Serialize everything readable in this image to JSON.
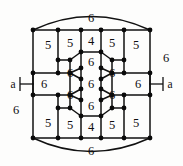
{
  "figure": {
    "background_color": "#fdfdfc",
    "line_color": "#111111",
    "vertex_color": "#0a0a0a"
  },
  "chart_data": {
    "type": "diagram",
    "title": "",
    "face_size_counts": {
      "4": 2,
      "5": 8,
      "6": 13
    },
    "faces": [
      {
        "id": "outer-top",
        "label": "6",
        "x": 91,
        "y": 18
      },
      {
        "id": "outer-bottom",
        "label": "6",
        "x": 91,
        "y": 151
      },
      {
        "id": "outer-left",
        "label": "6",
        "x": 16,
        "y": 110
      },
      {
        "id": "outer-right",
        "label": "6",
        "x": 166,
        "y": 58
      },
      {
        "id": "square-top",
        "label": "4",
        "x": 91,
        "y": 41
      },
      {
        "id": "square-bottom",
        "label": "4",
        "x": 91,
        "y": 127
      },
      {
        "id": "pent-top-far-left",
        "label": "5",
        "x": 48,
        "y": 45
      },
      {
        "id": "pent-top-left",
        "label": "5",
        "x": 70,
        "y": 43
      },
      {
        "id": "pent-top-right",
        "label": "5",
        "x": 112,
        "y": 43
      },
      {
        "id": "pent-top-far-right",
        "label": "5",
        "x": 136,
        "y": 45
      },
      {
        "id": "pent-bot-far-left",
        "label": "5",
        "x": 48,
        "y": 123
      },
      {
        "id": "pent-bot-left",
        "label": "5",
        "x": 70,
        "y": 125
      },
      {
        "id": "pent-bot-right",
        "label": "5",
        "x": 112,
        "y": 125
      },
      {
        "id": "pent-bot-far-right",
        "label": "5",
        "x": 136,
        "y": 123
      },
      {
        "id": "hex-center",
        "label": "6",
        "x": 91,
        "y": 84
      },
      {
        "id": "hex-north",
        "label": "6",
        "x": 91,
        "y": 62
      },
      {
        "id": "hex-south",
        "label": "6",
        "x": 91,
        "y": 106
      },
      {
        "id": "hex-nw",
        "label": "6",
        "x": 70,
        "y": 73
      },
      {
        "id": "hex-sw",
        "label": "6",
        "x": 70,
        "y": 95
      },
      {
        "id": "hex-ne",
        "label": "6",
        "x": 112,
        "y": 73
      },
      {
        "id": "hex-se",
        "label": "6",
        "x": 112,
        "y": 95
      },
      {
        "id": "hex-far-left",
        "label": "6",
        "x": 44,
        "y": 84
      },
      {
        "id": "hex-far-right",
        "label": "6",
        "x": 138,
        "y": 84
      }
    ],
    "edge_tags": [
      {
        "id": "tag-left",
        "label": "a",
        "x": 13,
        "y": 84
      },
      {
        "id": "tag-right",
        "label": "a",
        "x": 170,
        "y": 84
      }
    ]
  },
  "geometry": {
    "vertices": [
      {
        "x": 33,
        "y": 30
      },
      {
        "x": 58,
        "y": 30
      },
      {
        "x": 81,
        "y": 30
      },
      {
        "x": 101,
        "y": 30
      },
      {
        "x": 124,
        "y": 30
      },
      {
        "x": 150,
        "y": 30
      },
      {
        "x": 81,
        "y": 52
      },
      {
        "x": 101,
        "y": 52
      },
      {
        "x": 58,
        "y": 60
      },
      {
        "x": 124,
        "y": 60
      },
      {
        "x": 70,
        "y": 60
      },
      {
        "x": 112,
        "y": 60
      },
      {
        "x": 33,
        "y": 73
      },
      {
        "x": 58,
        "y": 73
      },
      {
        "x": 70,
        "y": 73
      },
      {
        "x": 81,
        "y": 68
      },
      {
        "x": 101,
        "y": 68
      },
      {
        "x": 112,
        "y": 73
      },
      {
        "x": 124,
        "y": 73
      },
      {
        "x": 150,
        "y": 73
      },
      {
        "x": 81,
        "y": 79
      },
      {
        "x": 101,
        "y": 79
      },
      {
        "x": 33,
        "y": 95
      },
      {
        "x": 58,
        "y": 95
      },
      {
        "x": 70,
        "y": 95
      },
      {
        "x": 81,
        "y": 89
      },
      {
        "x": 101,
        "y": 89
      },
      {
        "x": 112,
        "y": 95
      },
      {
        "x": 124,
        "y": 95
      },
      {
        "x": 150,
        "y": 95
      },
      {
        "x": 81,
        "y": 100
      },
      {
        "x": 101,
        "y": 100
      },
      {
        "x": 58,
        "y": 108
      },
      {
        "x": 124,
        "y": 108
      },
      {
        "x": 70,
        "y": 108
      },
      {
        "x": 112,
        "y": 108
      },
      {
        "x": 81,
        "y": 116
      },
      {
        "x": 101,
        "y": 116
      },
      {
        "x": 33,
        "y": 138
      },
      {
        "x": 58,
        "y": 138
      },
      {
        "x": 81,
        "y": 138
      },
      {
        "x": 101,
        "y": 138
      },
      {
        "x": 124,
        "y": 138
      },
      {
        "x": 150,
        "y": 138
      }
    ],
    "vertex_radius": 2.4
  }
}
